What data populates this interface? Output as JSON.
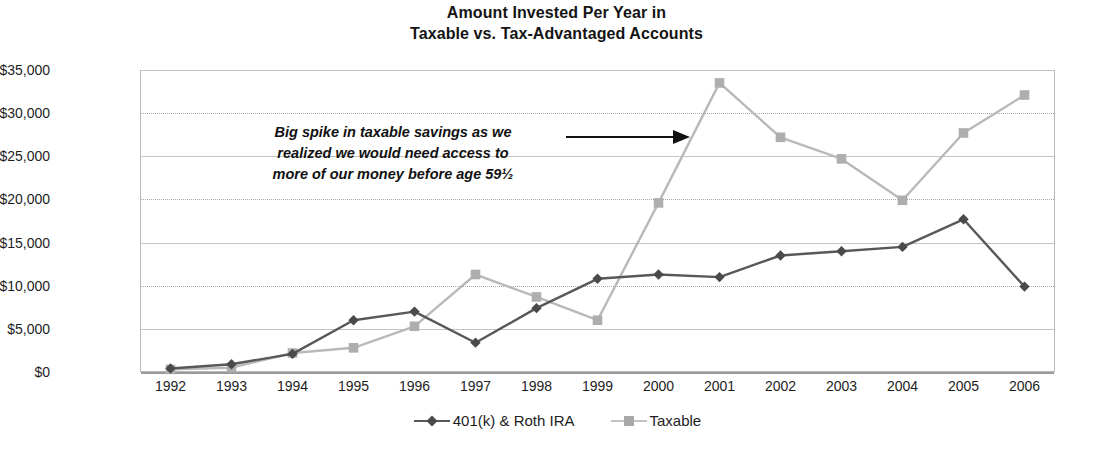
{
  "chart_data": {
    "type": "line",
    "title": "Amount Invested Per Year in Taxable vs. Tax-Advantaged Accounts",
    "title_line1": "Amount Invested Per Year in",
    "title_line2": "Taxable vs. Tax-Advantaged Accounts",
    "xlabel": "",
    "ylabel": "",
    "grid": true,
    "legend_position": "bottom",
    "ylim": [
      0,
      35000
    ],
    "ytick_step": 5000,
    "categories": [
      "1992",
      "1993",
      "1994",
      "1995",
      "1996",
      "1997",
      "1998",
      "1999",
      "2000",
      "2001",
      "2002",
      "2003",
      "2004",
      "2005",
      "2006"
    ],
    "ytick_labels": [
      "$0",
      "$5,000",
      "$10,000",
      "$15,000",
      "$20,000",
      "$25,000",
      "$30,000",
      "$35,000"
    ],
    "ytick_values": [
      0,
      5000,
      10000,
      15000,
      20000,
      25000,
      30000,
      35000
    ],
    "series": [
      {
        "name": "401(k) & Roth IRA",
        "color": "#585858",
        "marker": "diamond",
        "values": [
          400,
          900,
          2100,
          6000,
          7000,
          3400,
          7400,
          10800,
          11300,
          11000,
          13500,
          14000,
          14500,
          17700,
          9900
        ]
      },
      {
        "name": "Taxable",
        "color": "#b9b9b9",
        "marker": "square",
        "values": [
          300,
          500,
          2200,
          2800,
          5300,
          11300,
          8700,
          6000,
          19600,
          33500,
          27200,
          24700,
          19900,
          27700,
          32100
        ]
      }
    ],
    "annotations": [
      {
        "name": "taxable-spike-callout",
        "line1": "Big spike in taxable savings as we",
        "line2": "realized we would need access to",
        "line3": "more of our money before age 59½",
        "arrow": "right-arrow-to-2001"
      }
    ]
  },
  "legend": {
    "items": [
      {
        "label": "401(k) & Roth IRA",
        "key": "diamond-line-key",
        "color": "#585858"
      },
      {
        "label": "Taxable",
        "key": "square-line-key",
        "color": "#b9b9b9"
      }
    ]
  },
  "colors": {
    "series_dark": "#585858",
    "series_light": "#b9b9b9",
    "gridline": "#a9a9a9",
    "frame": "#b8b8b8",
    "text": "#1d1d1d"
  }
}
